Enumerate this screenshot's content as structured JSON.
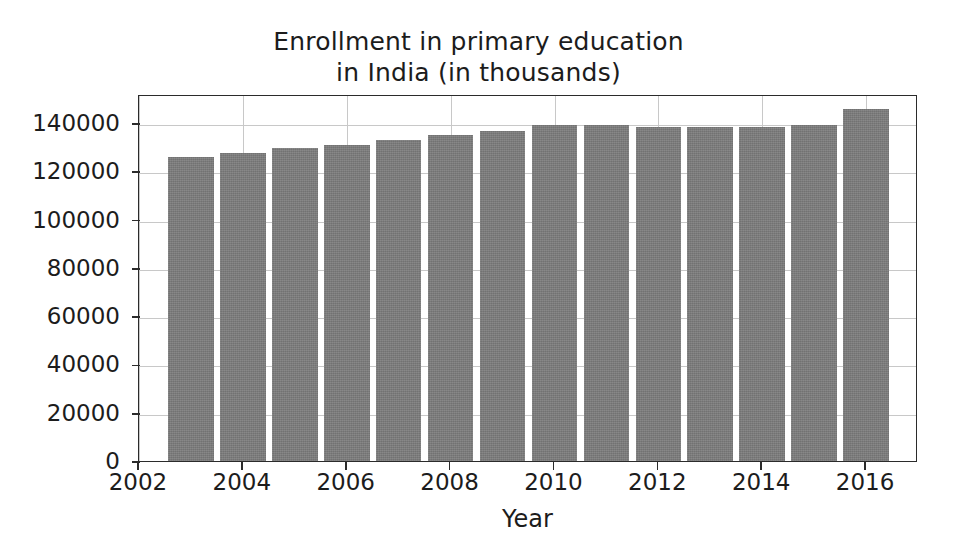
{
  "chart_data": {
    "type": "bar",
    "title": "Enrollment in primary education\nin India (in thousands)",
    "title_line1": "Enrollment in primary education",
    "title_line2": "in India (in thousands)",
    "xlabel": "Year",
    "ylabel": "",
    "categories": [
      2003,
      2004,
      2005,
      2006,
      2007,
      2008,
      2009,
      2010,
      2011,
      2012,
      2013,
      2014,
      2015,
      2016
    ],
    "values": [
      126000,
      127500,
      129500,
      131000,
      133000,
      135000,
      136800,
      139000,
      139000,
      138200,
      138200,
      138300,
      139200,
      145800
    ],
    "xlim": [
      2002,
      2017
    ],
    "ylim": [
      0,
      152000
    ],
    "xticks": [
      2002,
      2004,
      2006,
      2008,
      2010,
      2012,
      2014,
      2016
    ],
    "xtick_labels": [
      "2002",
      "2004",
      "2006",
      "2008",
      "2010",
      "2012",
      "2014",
      "2016"
    ],
    "yticks": [
      0,
      20000,
      40000,
      60000,
      80000,
      100000,
      120000,
      140000
    ],
    "ytick_labels": [
      "0",
      "20000",
      "40000",
      "60000",
      "80000",
      "100000",
      "120000",
      "140000"
    ],
    "grid": true,
    "legend": null,
    "bar_color": "#7d7d7d",
    "grid_color": "#c8c8c8",
    "axis_color": "#2b2b2b",
    "background_color": "#ffffff"
  }
}
